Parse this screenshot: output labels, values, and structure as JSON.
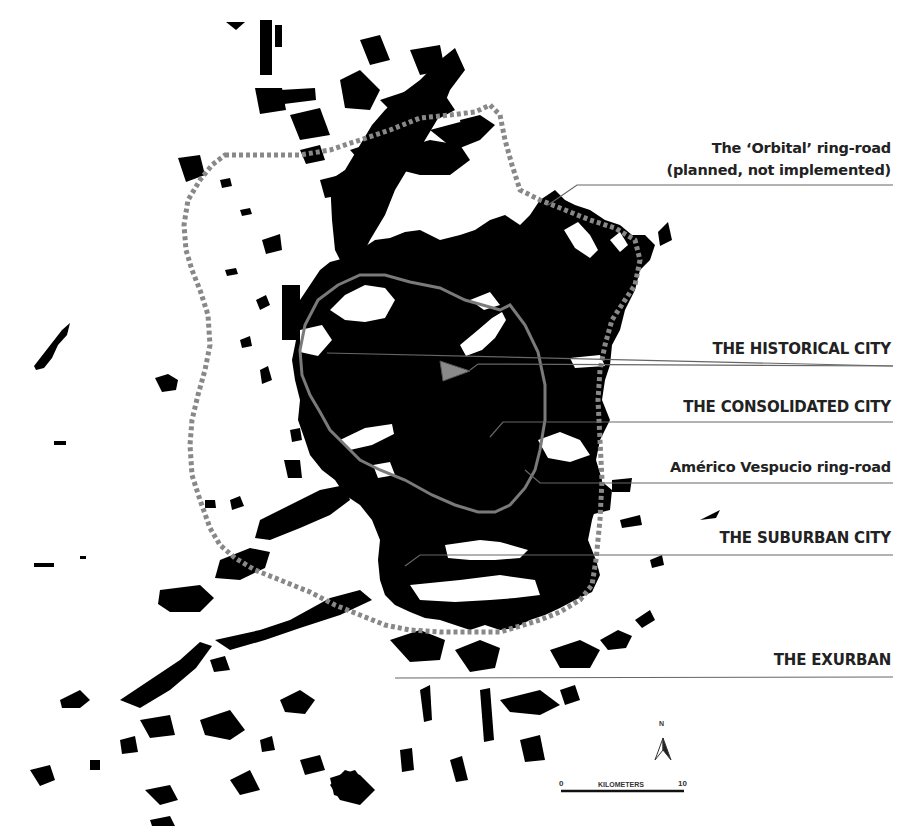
{
  "map": {
    "type": "urban-footprint figure-ground map",
    "colors": {
      "urban_fill": "#000000",
      "background": "#ffffff",
      "vespucio_ring": "#777777",
      "orbital_ring_dotted": "#888888",
      "historical_marker": "#888888",
      "leader_lines": "#666666",
      "label_text": "#222222"
    }
  },
  "labels": [
    {
      "id": "orbital",
      "line1": "The ‘Orbital’ ring-road",
      "line2": "(planned, not implemented)"
    },
    {
      "id": "historical",
      "text": "THE HISTORICAL CITY"
    },
    {
      "id": "consolidated",
      "text": "THE CONSOLIDATED CITY"
    },
    {
      "id": "vespucio",
      "text": "Américo Vespucio ring-road"
    },
    {
      "id": "suburban",
      "text": "THE SUBURBAN CITY"
    },
    {
      "id": "exurban",
      "text": "THE EXURBAN"
    }
  ],
  "north_arrow": {
    "letter": "N"
  },
  "scale_bar": {
    "start": "0",
    "end": "10",
    "unit": "KILOMETERS"
  }
}
